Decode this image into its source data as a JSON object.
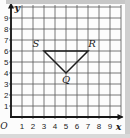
{
  "figure": {
    "origin_label": "O",
    "axis_labels": {
      "x": "x",
      "y": "y"
    },
    "x_tick_labels": [
      "1",
      "2",
      "3",
      "4",
      "5",
      "6",
      "7",
      "8",
      "9"
    ],
    "y_tick_labels": [
      "1",
      "2",
      "3",
      "4",
      "5",
      "6",
      "7",
      "8",
      "9"
    ],
    "colors": {
      "background": "#fcfcfc",
      "grid_line": "#575757",
      "axis": "#161616",
      "shape": "#1c1c1c",
      "text": "#1c1c1c",
      "border_top": "#c7c7c7",
      "border_right": "#cfcfcf",
      "border_bottom": "#d9d9d9"
    }
  },
  "chart_data": {
    "type": "scatter",
    "title": "",
    "xlabel": "x",
    "ylabel": "y",
    "xlim": [
      0,
      10
    ],
    "ylim": [
      0,
      10
    ],
    "grid": true,
    "x_ticks": [
      1,
      2,
      3,
      4,
      5,
      6,
      7,
      8,
      9
    ],
    "y_ticks": [
      1,
      2,
      3,
      4,
      5,
      6,
      7,
      8,
      9
    ],
    "origin_label": "O",
    "shape": {
      "kind": "polygon",
      "closed": true,
      "vertices": [
        {
          "label": "S",
          "x": 3,
          "y": 6,
          "label_side": "above-left"
        },
        {
          "label": "R",
          "x": 7,
          "y": 6,
          "label_side": "above-right"
        },
        {
          "label": "Q",
          "x": 5,
          "y": 4,
          "label_side": "below"
        }
      ]
    }
  }
}
